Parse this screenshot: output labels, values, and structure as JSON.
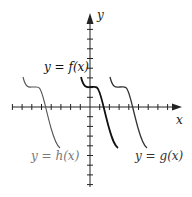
{
  "chart_data": {
    "type": "line",
    "title": "",
    "xlabel": "x",
    "ylabel": "y",
    "grid": false,
    "axis": {
      "origin_px": [
        90,
        107
      ],
      "unit_px": 9.7,
      "x_ticks_left": 8,
      "x_ticks_right": 8,
      "y_ticks_up": 8,
      "y_ticks_down": 8
    },
    "series": [
      {
        "name": "y = f(x)",
        "color": "#111111",
        "width": 1.8,
        "points": [
          [
            -1,
            3
          ],
          [
            0,
            2
          ],
          [
            0.7,
            2
          ],
          [
            1.5,
            0
          ],
          [
            2.9,
            -4.1
          ]
        ],
        "path_px": "M81,77 C84,89 87,87 91,87 C96,87 97,86 99,91 C102,98 104,110 109,128 C113,142 115,146 118,148"
      },
      {
        "name": "y = g(x)",
        "color": "#333333",
        "width": 1.3,
        "points": [
          [
            2,
            3
          ],
          [
            3,
            2
          ],
          [
            3.7,
            2
          ],
          [
            4.5,
            0
          ],
          [
            5.9,
            -4.1
          ]
        ],
        "path_px": "M110,77 C113,89 116,87 120,87 C125,87 126,86 128,91 C131,98 133,110 138,128 C142,142 144,146 147,148"
      },
      {
        "name": "y = h(x)",
        "color": "#555555",
        "width": 1.1,
        "points": [
          [
            -7,
            3
          ],
          [
            -6,
            2
          ],
          [
            -5.3,
            2
          ],
          [
            -4.5,
            0
          ],
          [
            -3.1,
            -4.1
          ]
        ],
        "path_px": "M23,77 C26,89 29,87 33,87 C38,87 39,86 41,91 C44,98 46,110 51,128 C55,142 57,146 60,148"
      }
    ],
    "annotations": [
      {
        "text": "y = f(x)",
        "x_px": 44,
        "y_px": 71,
        "color": "#111111"
      },
      {
        "text": "y = g(x)",
        "x_px": 135,
        "y_px": 160,
        "color": "#333333"
      },
      {
        "text": "y = h(x)",
        "x_px": 31,
        "y_px": 160,
        "color": "#777777"
      }
    ]
  },
  "labels": {
    "x_axis": "x",
    "y_axis": "y",
    "f": "y = f(x)",
    "g": "y = g(x)",
    "h": "y = h(x)"
  }
}
